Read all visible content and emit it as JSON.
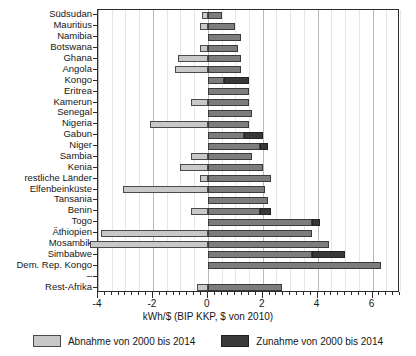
{
  "chart_data": {
    "type": "bar",
    "orientation": "horizontal",
    "stacked": true,
    "title": "",
    "xlabel": "kWh/$ (BIP KKP, $ von 2010)",
    "ylabel": "",
    "xlim": [
      -4,
      7
    ],
    "xticks": [
      -4,
      -2,
      0,
      2,
      4,
      6
    ],
    "xtick_labels": [
      "-4",
      "-2",
      "0",
      "2",
      "4",
      "6"
    ],
    "grid": true,
    "grid_axis": "x",
    "legend_position": "bottom",
    "categories": [
      "Südsudan",
      "Mauritius",
      "Namibia",
      "Botswana",
      "Ghana",
      "Angola",
      "Kongo",
      "Eritrea",
      "Kamerun",
      "Senegal",
      "Nigeria",
      "Gabun",
      "Niger",
      "Sambia",
      "Kenia",
      "restliche Länder",
      "Elfenbeinküste",
      "Tansania",
      "Benin",
      "Togo",
      "Äthiopien",
      "Mosambik",
      "Simbabwe",
      "Dem. Rep. Kongo",
      "–",
      "Rest-Afrika"
    ],
    "series": [
      {
        "name": "Abnahme von 2000 bis 2014",
        "color": "#c8c8c8",
        "values": [
          -0.2,
          -0.3,
          0.0,
          -0.3,
          -1.1,
          -1.2,
          0.0,
          0.0,
          -0.6,
          0.0,
          -2.1,
          0.0,
          0.0,
          -0.6,
          -1.0,
          -0.3,
          -3.1,
          0.0,
          -0.6,
          0.0,
          -3.9,
          -4.3,
          0.0,
          0.0,
          0.0,
          -0.4
        ]
      },
      {
        "name": "Zunahme von 2000 bis 2014",
        "color": "#7d7d7d",
        "values": [
          0.5,
          1.0,
          1.2,
          1.1,
          1.2,
          1.2,
          1.5,
          1.5,
          1.5,
          1.6,
          1.5,
          2.0,
          2.2,
          1.6,
          2.0,
          2.3,
          2.1,
          2.2,
          2.3,
          4.1,
          3.8,
          4.4,
          5.0,
          6.3,
          0.0,
          2.7
        ]
      }
    ],
    "highlighted_increase_segments": {
      "note": "darker shade portion of the increase bar",
      "rows": {
        "Kongo": [
          0.6,
          1.5
        ],
        "Gabun": [
          1.3,
          2.0
        ],
        "Niger": [
          1.9,
          2.2
        ],
        "Benin": [
          1.9,
          2.3
        ],
        "Togo": [
          3.8,
          4.1
        ],
        "Simbabwe": [
          3.8,
          5.0
        ]
      }
    }
  },
  "legend": {
    "items": [
      {
        "label": "Abnahme von 2000 bis 2014",
        "swatch": "decrease"
      },
      {
        "label": "Zunahme von 2000 bis 2014",
        "swatch": "increase"
      }
    ]
  },
  "axis": {
    "x_title": "kWh/$ (BIP KKP, $ von 2010)"
  }
}
